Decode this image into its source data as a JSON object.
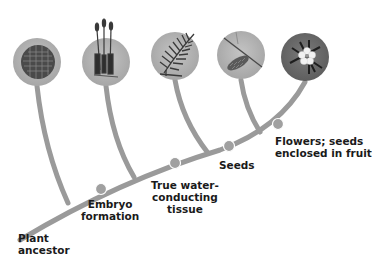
{
  "diagram": {
    "type": "cladogram",
    "colors": {
      "branch": "#9a9a9a",
      "node": "#a0a0a0",
      "circle_fill": "#b0b0b0",
      "flower_circle_fill": "#6e6e6e",
      "text": "#1a1a1a"
    },
    "root_label": [
      "Plant",
      "ancestor"
    ],
    "traits": [
      {
        "id": "embryo",
        "lines": [
          "Embryo",
          "formation"
        ]
      },
      {
        "id": "vascular",
        "lines": [
          "True water-",
          "conducting",
          "tissue"
        ]
      },
      {
        "id": "seeds",
        "lines": [
          "Seeds"
        ]
      },
      {
        "id": "flowers",
        "lines": [
          "Flowers; seeds",
          "enclosed in fruit"
        ]
      }
    ],
    "taxa": [
      {
        "id": "algae-like",
        "icon": "moss-mat-icon"
      },
      {
        "id": "moss",
        "icon": "moss-sporophyte-icon"
      },
      {
        "id": "fern",
        "icon": "fern-frond-icon"
      },
      {
        "id": "conifer",
        "icon": "conifer-cone-icon"
      },
      {
        "id": "flowering",
        "icon": "flower-icon"
      }
    ]
  }
}
